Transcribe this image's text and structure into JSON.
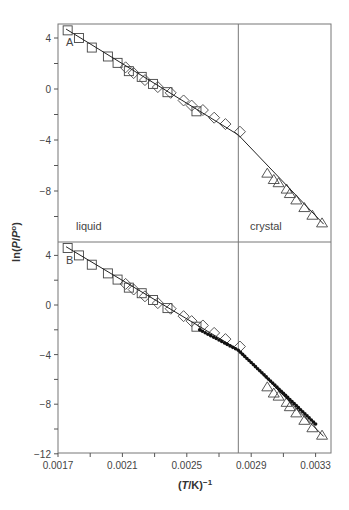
{
  "chart_data": {
    "type": "scatter",
    "title": "",
    "xlabel": "(T/K)^-1",
    "xlabel_parts": {
      "open": "(",
      "italic": "T",
      "mid": "/K)",
      "sup": "−1"
    },
    "ylabel": "ln(P/P°)",
    "ylabel_parts": {
      "pre": "ln(",
      "italic1": "P",
      "slash": "/",
      "italic2": "P",
      "sup": "o",
      "post": ")"
    },
    "xlim": [
      0.0017,
      0.00335
    ],
    "x_ticks": [
      0.0017,
      0.0019,
      0.0021,
      0.0023,
      0.0025,
      0.0027,
      0.0029,
      0.0031,
      0.0033
    ],
    "x_tick_labels": [
      "0.0017",
      "",
      "0.0021",
      "",
      "0.0025",
      "",
      "0.0029",
      "",
      "0.0033"
    ],
    "transition_x": 0.00282,
    "region_labels": {
      "left": "liquid",
      "right": "crystal"
    },
    "panels": [
      {
        "label": "A",
        "ylim": [
          -12,
          5
        ],
        "y_ticks": [
          4,
          2,
          0,
          -2,
          -4,
          -6,
          -8,
          -10
        ],
        "y_tick_labels": [
          "4",
          "",
          "0",
          "",
          "−4",
          "",
          "−8",
          ""
        ],
        "series": [
          {
            "name": "squares",
            "marker": "square",
            "x": [
              0.00176,
              0.00183,
              0.00191,
              0.00201,
              0.00207,
              0.00214,
              0.00222,
              0.00229,
              0.00238,
              0.00256
            ],
            "y": [
              4.6,
              4.0,
              3.25,
              2.55,
              2.05,
              1.4,
              0.95,
              0.4,
              -0.25,
              -1.75
            ]
          },
          {
            "name": "diamonds",
            "marker": "diamond",
            "x": [
              0.00212,
              0.00217,
              0.00224,
              0.00232,
              0.0024,
              0.00248,
              0.00253,
              0.0026,
              0.00267,
              0.00274,
              0.00283
            ],
            "y": [
              1.7,
              1.25,
              0.7,
              0.15,
              -0.3,
              -0.9,
              -1.3,
              -1.65,
              -2.25,
              -2.75,
              -3.35
            ]
          },
          {
            "name": "triangles",
            "marker": "triangle",
            "x": [
              0.003,
              0.00304,
              0.00307,
              0.00312,
              0.00314,
              0.00318,
              0.00323,
              0.00328,
              0.00334
            ],
            "y": [
              -6.6,
              -7.1,
              -7.35,
              -7.85,
              -8.2,
              -8.7,
              -9.3,
              -9.9,
              -10.5
            ]
          },
          {
            "name": "fit-line",
            "marker": "line",
            "x": [
              0.00175,
              0.00282,
              0.00335
            ],
            "y": [
              4.7,
              -3.6,
              -10.6
            ]
          }
        ]
      },
      {
        "label": "B",
        "ylim": [
          -12,
          5
        ],
        "y_ticks": [
          4,
          2,
          0,
          -2,
          -4,
          -6,
          -8,
          -10,
          -12
        ],
        "y_tick_labels": [
          "4",
          "",
          "0",
          "",
          "−4",
          "",
          "−8",
          "",
          "−12"
        ],
        "series": [
          {
            "name": "squares",
            "marker": "square",
            "x": [
              0.00176,
              0.00183,
              0.00191,
              0.00201,
              0.00207,
              0.00214,
              0.00222,
              0.00229,
              0.00238,
              0.00256
            ],
            "y": [
              4.6,
              4.0,
              3.25,
              2.55,
              2.05,
              1.4,
              0.95,
              0.4,
              -0.25,
              -1.75
            ]
          },
          {
            "name": "diamonds",
            "marker": "diamond",
            "x": [
              0.00212,
              0.00217,
              0.00224,
              0.00232,
              0.0024,
              0.00248,
              0.00253,
              0.0026,
              0.00267,
              0.00274,
              0.00283
            ],
            "y": [
              1.7,
              1.25,
              0.7,
              0.15,
              -0.3,
              -0.9,
              -1.3,
              -1.65,
              -2.25,
              -2.75,
              -3.35
            ]
          },
          {
            "name": "triangles",
            "marker": "triangle",
            "x": [
              0.003,
              0.00304,
              0.00307,
              0.00312,
              0.00314,
              0.00318,
              0.00323,
              0.00328,
              0.00334
            ],
            "y": [
              -6.6,
              -7.1,
              -7.35,
              -7.85,
              -8.2,
              -8.7,
              -9.3,
              -9.9,
              -10.5
            ]
          },
          {
            "name": "fit-line",
            "marker": "line",
            "x": [
              0.00175,
              0.00282,
              0.00335
            ],
            "y": [
              4.7,
              -3.6,
              -10.6
            ]
          },
          {
            "name": "simulation-dots",
            "marker": "dot",
            "x_start": 0.00258,
            "x_break": 0.00282,
            "x_end": 0.0033,
            "y_start": -2.0,
            "y_break": -3.65,
            "y_end": -9.6,
            "count_before": 14,
            "count_after": 36
          }
        ]
      }
    ],
    "grid": false,
    "legend": null
  }
}
